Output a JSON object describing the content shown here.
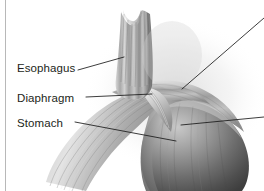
{
  "figure": {
    "background_color": "#ffffff",
    "border_color": "#b8b8b8",
    "label_color": "#231f20",
    "leader_line_color": "#1a1a1a",
    "width": 264,
    "height": 191
  },
  "labels": [
    {
      "id": "esophagus",
      "text": "Esophagus"
    },
    {
      "id": "diaphragm",
      "text": "Diaphragm"
    },
    {
      "id": "stomach",
      "text": "Stomach"
    }
  ],
  "leader_lines": [
    {
      "id": "esophagus-leader",
      "from_x": 78,
      "from_y": 70,
      "to_x": 124,
      "to_y": 57
    },
    {
      "id": "diaphragm-leader",
      "from_x": 86,
      "from_y": 97,
      "to_x": 152,
      "to_y": 94
    },
    {
      "id": "stomach-leader",
      "from_x": 75,
      "from_y": 122,
      "to_x": 176,
      "to_y": 141
    },
    {
      "id": "upper-right-leader",
      "from_x": 182,
      "from_y": 89,
      "to_x": 264,
      "to_y": 18
    },
    {
      "id": "lower-right-leader",
      "from_x": 181,
      "from_y": 125,
      "to_x": 264,
      "to_y": 117
    }
  ],
  "anatomy_parts": [
    {
      "id": "esophagus-tube",
      "name": "esophagus"
    },
    {
      "id": "diaphragm-sheet",
      "name": "diaphragm"
    },
    {
      "id": "stomach-fundus",
      "name": "stomach"
    },
    {
      "id": "gastroesophageal-junction",
      "name": "gastroesophageal junction"
    }
  ]
}
